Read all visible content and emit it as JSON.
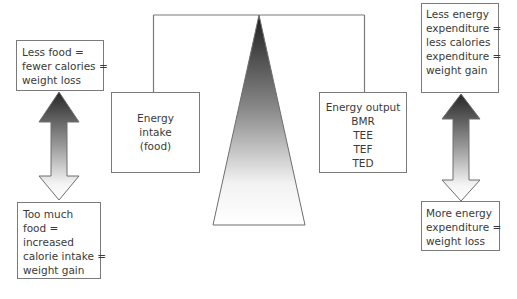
{
  "diagram": {
    "left_panel": {
      "top_box": {
        "lines": [
          "Less food =",
          "fewer calories =",
          "weight loss"
        ]
      },
      "bottom_box": {
        "lines": [
          "Too much",
          "food =",
          "increased",
          "calorie intake =",
          "weight gain"
        ]
      },
      "arrow": {
        "direction": "double-vertical",
        "top_color": "#2b2b2b",
        "bottom_color": "#ffffff"
      }
    },
    "scale": {
      "intake_box": {
        "lines": [
          "Energy",
          "intake",
          "(food)"
        ]
      },
      "output_box": {
        "lines": [
          "Energy output",
          "BMR",
          "TEE",
          "TEF",
          "TED"
        ]
      },
      "fulcrum": {
        "shape": "triangle",
        "top_color": "#1e1e1e",
        "bottom_color": "#ffffff"
      },
      "beam_color": "#7a7a7a"
    },
    "right_panel": {
      "top_box": {
        "lines": [
          "Less energy",
          "expenditure =",
          "less calories",
          "expenditure =",
          "weight gain"
        ]
      },
      "bottom_box": {
        "lines": [
          "More energy",
          "expenditure =",
          "weight loss"
        ]
      },
      "arrow": {
        "direction": "double-vertical",
        "top_color": "#2b2b2b",
        "bottom_color": "#ffffff"
      }
    }
  }
}
